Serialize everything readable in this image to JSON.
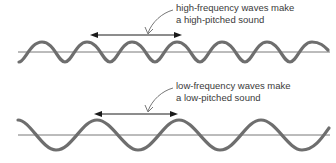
{
  "diagram": {
    "colors": {
      "wave": "#6e6e6e",
      "axis": "#555555",
      "arrow": "#1a1a1a",
      "pointer": "#777777",
      "text": "#3a3a3a"
    },
    "panels": [
      {
        "id": "high-frequency",
        "label_line1": "high-frequency waves make",
        "label_line2": "a high-pitched sound",
        "wave_period_px": 45,
        "wavelength_arrow": "double-headed arrow spanning two wavelengths"
      },
      {
        "id": "low-frequency",
        "label_line1": "low-frequency waves make",
        "label_line2": "a low-pitched sound",
        "wave_period_px": 82,
        "wavelength_arrow": "double-headed arrow spanning one wavelength"
      }
    ]
  }
}
